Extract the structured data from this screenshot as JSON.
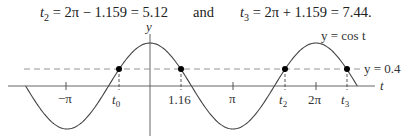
{
  "equations": {
    "t2": {
      "var": "t",
      "sub": "2",
      "expr": " = 2π − 1.159 = 5.12"
    },
    "connector": "and",
    "t3": {
      "var": "t",
      "sub": "3",
      "expr": " = 2π + 1.159 = 7.44."
    }
  },
  "chart_data": {
    "type": "line",
    "title": "",
    "xlabel": "t",
    "ylabel": "y",
    "series": [
      {
        "name": "y = cos t",
        "function": "cos(t)",
        "t_range": [
          -4.712,
          7.854
        ],
        "style": "solid"
      },
      {
        "name": "y = 0.4",
        "function": "0.4",
        "style": "dashed"
      }
    ],
    "x_ticks": [
      {
        "value": -3.1416,
        "label": "−π"
      },
      {
        "value": -1.159,
        "label": "t0"
      },
      {
        "value": 1.16,
        "label": "1.16"
      },
      {
        "value": 3.1416,
        "label": "π"
      },
      {
        "value": 5.12,
        "label": "t2"
      },
      {
        "value": 6.2832,
        "label": "2π"
      },
      {
        "value": 7.44,
        "label": "t3"
      }
    ],
    "intersection_points": [
      {
        "t": -1.159,
        "y": 0.4,
        "label": "t0"
      },
      {
        "t": 1.159,
        "y": 0.4,
        "label": "1.16"
      },
      {
        "t": 5.12,
        "y": 0.4,
        "label": "t2"
      },
      {
        "t": 7.44,
        "y": 0.4,
        "label": "t3"
      }
    ],
    "annotations": [
      "y = cos t",
      "y = 0.4"
    ],
    "grid": false,
    "legend": "none"
  },
  "labels": {
    "y_axis": "y",
    "t_axis": "t",
    "curve": "y = cos t",
    "line": "y = 0.4",
    "neg_pi": "−π",
    "t0": "t",
    "t0_sub": "0",
    "tick_116": "1.16",
    "pi": "π",
    "t2": "t",
    "t2_sub": "2",
    "two_pi": "2π",
    "t3": "t",
    "t3_sub": "3"
  }
}
